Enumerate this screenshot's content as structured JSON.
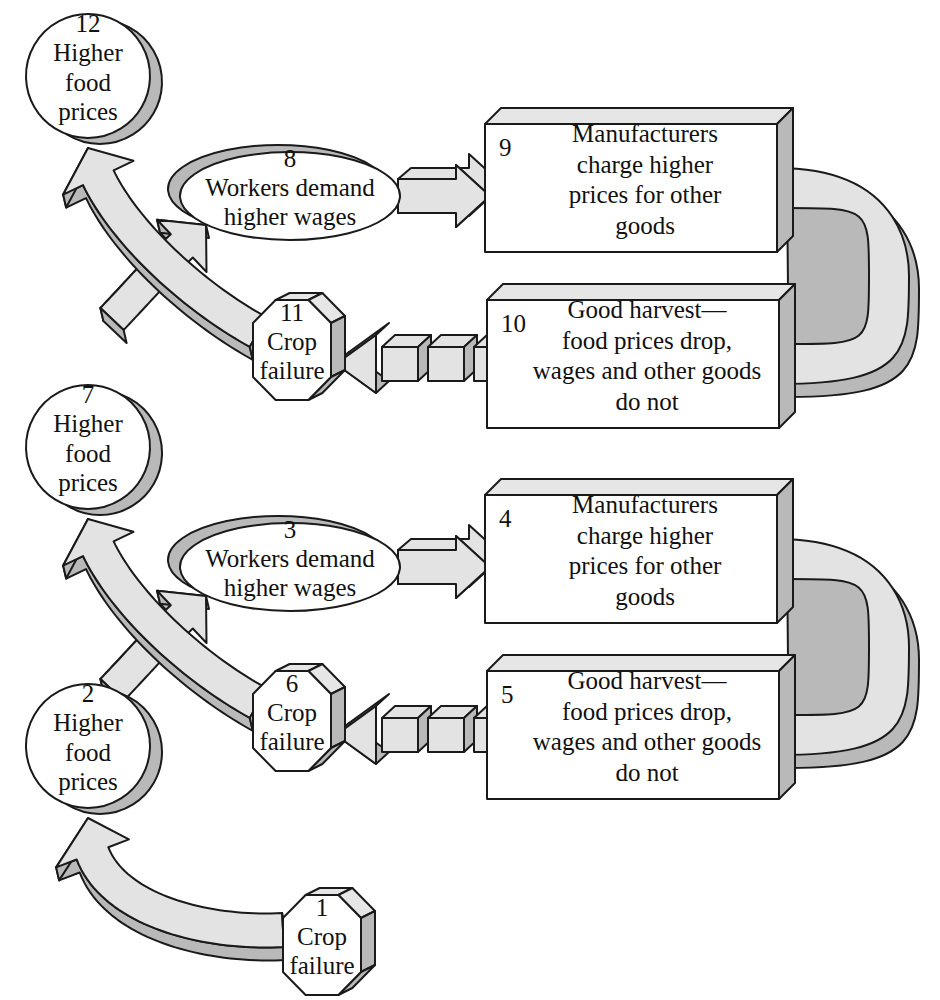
{
  "diagram": {
    "style": {
      "face_fill": "#ffffff",
      "top_fill": "#e6e6e6",
      "side_fill": "#b9b9b9",
      "arrow_fill": "#e3e3e3",
      "arrow_side_fill": "#b9b9b9",
      "stroke": "#1a1a1a",
      "text_color": "#111111"
    },
    "shape_types": {
      "hexagon": "crop-failure",
      "circle": "higher-food-prices",
      "ellipse": "workers-demand-higher-wages",
      "box": "manufacturers-and-harvest"
    },
    "nodes": [
      {
        "id": 1,
        "num": "1",
        "shape": "hexagon",
        "lines": [
          "Crop",
          "failure"
        ]
      },
      {
        "id": 2,
        "num": "2",
        "shape": "circle",
        "lines": [
          "Higher",
          "food",
          "prices"
        ]
      },
      {
        "id": 3,
        "num": "3",
        "shape": "ellipse",
        "lines": [
          "Workers demand",
          "higher wages"
        ]
      },
      {
        "id": 4,
        "num": "4",
        "shape": "box",
        "lines": [
          "Manufacturers",
          "charge higher",
          "prices for other",
          "goods"
        ]
      },
      {
        "id": 5,
        "num": "5",
        "shape": "box",
        "lines": [
          "Good harvest—",
          "food prices drop,",
          "wages and other goods",
          "do not"
        ]
      },
      {
        "id": 6,
        "num": "6",
        "shape": "hexagon",
        "lines": [
          "Crop",
          "failure"
        ]
      },
      {
        "id": 7,
        "num": "7",
        "shape": "circle",
        "lines": [
          "Higher",
          "food",
          "prices"
        ]
      },
      {
        "id": 8,
        "num": "8",
        "shape": "ellipse",
        "lines": [
          "Workers demand",
          "higher wages"
        ]
      },
      {
        "id": 9,
        "num": "9",
        "shape": "box",
        "lines": [
          "Manufacturers",
          "charge higher",
          "prices for other",
          "goods"
        ]
      },
      {
        "id": 10,
        "num": "10",
        "shape": "box",
        "lines": [
          "Good harvest—",
          "food prices drop,",
          "wages and other goods",
          "do not"
        ]
      },
      {
        "id": 11,
        "num": "11",
        "shape": "hexagon",
        "lines": [
          "Crop",
          "failure"
        ]
      },
      {
        "id": 12,
        "num": "12",
        "shape": "circle",
        "lines": [
          "Higher",
          "food",
          "prices"
        ]
      }
    ],
    "edges": [
      {
        "from": 1,
        "to": 2,
        "style": "solid",
        "kind": "curved-arrow"
      },
      {
        "from": 2,
        "to": 3,
        "style": "solid",
        "kind": "curved-arrow"
      },
      {
        "from": 3,
        "to": 4,
        "style": "solid",
        "kind": "block-arrow"
      },
      {
        "from": 4,
        "to": 5,
        "style": "solid",
        "kind": "c-band"
      },
      {
        "from": 5,
        "to": 6,
        "style": "dashed",
        "kind": "dashed-arrow"
      },
      {
        "from": 6,
        "to": 7,
        "style": "solid",
        "kind": "curved-arrow"
      },
      {
        "from": 7,
        "to": 8,
        "style": "solid",
        "kind": "curved-arrow"
      },
      {
        "from": 8,
        "to": 9,
        "style": "solid",
        "kind": "block-arrow"
      },
      {
        "from": 9,
        "to": 10,
        "style": "solid",
        "kind": "c-band"
      },
      {
        "from": 10,
        "to": 11,
        "style": "dashed",
        "kind": "dashed-arrow"
      },
      {
        "from": 11,
        "to": 12,
        "style": "solid",
        "kind": "curved-arrow"
      }
    ]
  }
}
